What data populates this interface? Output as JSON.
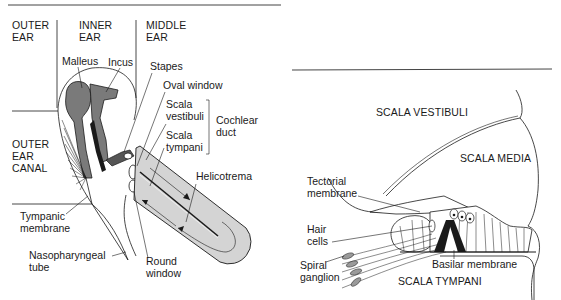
{
  "left_diagram": {
    "title": "Ear anatomy with uncoiled cochlea",
    "regions": {
      "outer_ear": [
        "OUTER",
        "EAR"
      ],
      "inner_ear": [
        "INNER",
        "EAR"
      ],
      "middle_ear": [
        "MIDDLE",
        "EAR"
      ],
      "outer_ear_canal": [
        "OUTER",
        "EAR",
        "CANAL"
      ]
    },
    "labels": {
      "malleus": "Malleus",
      "incus": "Incus",
      "stapes": "Stapes",
      "oval_window": "Oval window",
      "scala_vestibuli": [
        "Scala",
        "vestibuli"
      ],
      "scala_tympani": [
        "Scala",
        "tympani"
      ],
      "cochlear_duct": [
        "Cochlear",
        "duct"
      ],
      "helicotrema": "Helicotrema",
      "tympanic_membrane": [
        "Tympanic",
        "membrane"
      ],
      "nasopharyngeal_tube": [
        "Nasopharyngeal",
        "tube"
      ],
      "round_window": [
        "Round",
        "window"
      ]
    },
    "colors": {
      "bone_fill": "#7a7a7a",
      "cochlea_fill": "#d4d4d4",
      "line": "#1a1a1a"
    }
  },
  "right_diagram": {
    "title": "Cross-section of cochlear duct",
    "regions": {
      "scala_vestibuli": "SCALA VESTIBULI",
      "scala_media": "SCALA MEDIA",
      "scala_tympani": "SCALA TYMPANI"
    },
    "labels": {
      "tectorial_membrane": [
        "Tectorial",
        "membrane"
      ],
      "hair_cells": [
        "Hair",
        "cells"
      ],
      "spiral_ganglion": [
        "Spiral",
        "ganglion"
      ],
      "basilar_membrane": "Basilar membrane"
    },
    "colors": {
      "ganglion_fill": "#9a9a9a",
      "line": "#1a1a1a"
    }
  }
}
